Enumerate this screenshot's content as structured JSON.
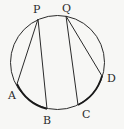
{
  "diagram": {
    "type": "circle-chords",
    "circle": {
      "cx": 57.5,
      "cy": 62.5,
      "r": 47
    },
    "points": {
      "P": {
        "label": "P",
        "x": 38,
        "y": 19
      },
      "Q": {
        "label": "Q",
        "x": 66,
        "y": 16
      },
      "A": {
        "label": "A",
        "x": 17,
        "y": 84
      },
      "B": {
        "label": "B",
        "x": 47,
        "y": 109
      },
      "C": {
        "label": "C",
        "x": 78,
        "y": 105
      },
      "D": {
        "label": "D",
        "x": 102,
        "y": 76
      }
    },
    "segments": [
      {
        "from": "P",
        "to": "A"
      },
      {
        "from": "P",
        "to": "B"
      },
      {
        "from": "Q",
        "to": "C"
      },
      {
        "from": "Q",
        "to": "D"
      }
    ],
    "stroke_color": "#2a2a2a"
  }
}
